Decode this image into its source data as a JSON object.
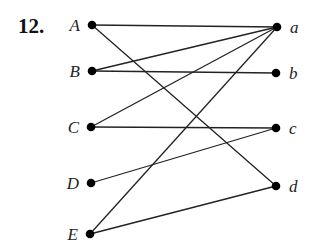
{
  "problem_number": "12.",
  "left_nodes": [
    {
      "id": "A",
      "label": "A",
      "x": 92,
      "y": 25
    },
    {
      "id": "B",
      "label": "B",
      "x": 92,
      "y": 71
    },
    {
      "id": "C",
      "label": "C",
      "x": 91,
      "y": 127
    },
    {
      "id": "D",
      "label": "D",
      "x": 91,
      "y": 183
    },
    {
      "id": "E",
      "label": "E",
      "x": 90,
      "y": 234
    }
  ],
  "right_nodes": [
    {
      "id": "a",
      "label": "a",
      "x": 277,
      "y": 27
    },
    {
      "id": "b",
      "label": "b",
      "x": 276,
      "y": 73
    },
    {
      "id": "c",
      "label": "c",
      "x": 276,
      "y": 128
    },
    {
      "id": "d",
      "label": "d",
      "x": 276,
      "y": 186
    }
  ],
  "edges": [
    [
      "A",
      "a"
    ],
    [
      "A",
      "d"
    ],
    [
      "B",
      "a"
    ],
    [
      "B",
      "b"
    ],
    [
      "C",
      "a"
    ],
    [
      "C",
      "c"
    ],
    [
      "D",
      "c"
    ],
    [
      "E",
      "a"
    ],
    [
      "E",
      "d"
    ]
  ],
  "colors": {
    "line": "#222222",
    "node": "#000000"
  }
}
